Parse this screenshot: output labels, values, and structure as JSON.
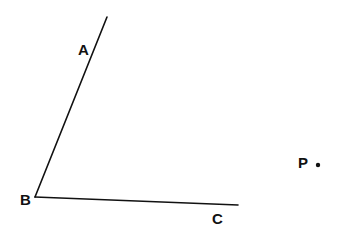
{
  "diagram": {
    "type": "geometry-angle",
    "points": {
      "A": {
        "label": "A",
        "x": 78,
        "y": 55
      },
      "B": {
        "label": "B",
        "x": 20,
        "y": 205
      },
      "C": {
        "label": "C",
        "x": 212,
        "y": 224
      },
      "P": {
        "label": "P",
        "x": 298,
        "y": 168
      }
    },
    "segments": [
      {
        "name": "ray-BA",
        "x1": 35,
        "y1": 197,
        "x2": 107,
        "y2": 17
      },
      {
        "name": "ray-BC",
        "x1": 35,
        "y1": 197,
        "x2": 238,
        "y2": 205
      }
    ],
    "dot": {
      "name": "point-P",
      "cx": 318,
      "cy": 165,
      "r": 2.2
    },
    "stroke_color": "#111111"
  }
}
